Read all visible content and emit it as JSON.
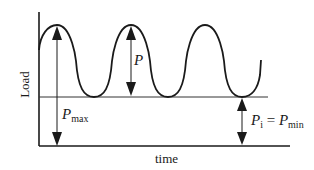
{
  "diagram": {
    "axes": {
      "ylabel": "Load",
      "xlabel": "time"
    },
    "annotations": {
      "p_max": {
        "symbol": "P",
        "subscript": "max"
      },
      "p_amplitude": {
        "symbol": "P"
      },
      "p_min": {
        "symbol": "P",
        "subscript": "i",
        "equals": " = ",
        "rhs_symbol": "P",
        "rhs_subscript": "min"
      }
    },
    "colors": {
      "curve": "#1a1a1a",
      "axis": "#1a1a1a",
      "baseline": "#333333",
      "arrow": "#1a1a1a"
    }
  }
}
